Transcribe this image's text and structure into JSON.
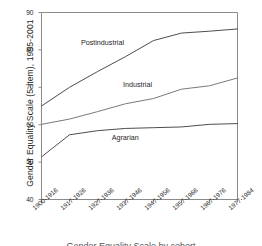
{
  "chart_data": {
    "type": "line",
    "title": "",
    "xlabel": "",
    "ylabel": "Gender Equality Scale (5-item), 1995-2001",
    "ylim": [
      40,
      90
    ],
    "yticks": [
      40,
      50,
      60,
      70,
      80,
      90
    ],
    "grid": false,
    "legend_position": "inline-labels",
    "categories": [
      "1900-1916",
      "1917-1926",
      "1927-1936",
      "1937-1946",
      "1947-1956",
      "1957-1966",
      "1967-1976",
      "1977-1984"
    ],
    "series": [
      {
        "name": "Postindustrial",
        "color": "#4d4d4d",
        "values": [
          65.0,
          70.0,
          74.2,
          78.2,
          82.5,
          84.5,
          85.0,
          85.6
        ]
      },
      {
        "name": "Industrial",
        "color": "#7a7a7a",
        "values": [
          60.1,
          61.5,
          63.5,
          65.6,
          67.0,
          69.5,
          70.4,
          72.5
        ]
      },
      {
        "name": "Agrarian",
        "color": "#4d4d4d",
        "values": [
          51.4,
          57.3,
          58.4,
          59.0,
          59.2,
          59.4,
          60.1,
          60.3
        ]
      }
    ],
    "annotations": [
      {
        "text": "Postindustrial",
        "x_index": 2.05,
        "y_value": 81.8
      },
      {
        "text": "Industrial",
        "x_index": 3.55,
        "y_value": 70.5
      },
      {
        "text": "Agrarian",
        "x_index": 3.15,
        "y_value": 56.4
      }
    ]
  },
  "caption": {
    "text": "Gender Equality Scale by cohort"
  },
  "colors": {
    "axis": "#8a8a8a",
    "text": "#1f1f1f",
    "background": "#ffffff"
  }
}
